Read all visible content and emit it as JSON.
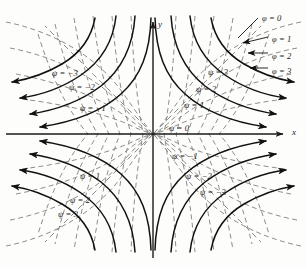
{
  "figure": {
    "background": "#fdfdfb",
    "stream_color": "#111111",
    "potential_color": "#8d8d8d",
    "axis_color": "#1a1a1a"
  },
  "axes": {
    "x_label": "x",
    "y_label": "y",
    "origin": {
      "x": 153,
      "y": 134
    },
    "x_range": [
      -155,
      155
    ],
    "y_range": [
      -134,
      134
    ]
  },
  "chart_data": {
    "type": "line",
    "xlabel": "x",
    "ylabel": "y",
    "grid": false,
    "legend": "none",
    "series": [
      {
        "name": "streamlines",
        "style": "solid",
        "color": "#111111",
        "equation": "psi = k, hyperbolas x*y = constant",
        "arrowheads": true,
        "levels": [
          {
            "label": "ψ = 0",
            "value": 0,
            "quadrant": "all",
            "form": "diagonal asymptotes through origin"
          },
          {
            "label": "ψ = 1",
            "value": 1,
            "quadrant": "upper-right"
          },
          {
            "label": "ψ = 2",
            "value": 2,
            "quadrant": "upper-right"
          },
          {
            "label": "ψ = 3",
            "value": 3,
            "quadrant": "upper-right"
          },
          {
            "label": "ψ = −1",
            "value": -1,
            "quadrant": "upper-left"
          },
          {
            "label": "ψ = −2",
            "value": -2,
            "quadrant": "upper-left"
          },
          {
            "label": "ψ = −3",
            "value": -3,
            "quadrant": "upper-left"
          },
          {
            "label": "ψ = 1",
            "value": 1,
            "quadrant": "lower-left"
          },
          {
            "label": "ψ = 2",
            "value": 2,
            "quadrant": "lower-left"
          },
          {
            "label": "ψ = 3",
            "value": 3,
            "quadrant": "lower-left"
          },
          {
            "label": "ψ = −1",
            "value": -1,
            "quadrant": "lower-right"
          },
          {
            "label": "ψ = −2",
            "value": -2,
            "quadrant": "lower-right"
          },
          {
            "label": "ψ = −3",
            "value": -3,
            "quadrant": "lower-right"
          }
        ]
      },
      {
        "name": "equipotentials",
        "style": "dashed",
        "color": "#8d8d8d",
        "equation": "phi = k, hyperbolas x^2 - y^2 = constant",
        "arrowheads": false,
        "levels": [
          {
            "label": "φ = 0",
            "value": 0
          },
          {
            "label": "φ = 1",
            "value": 1
          },
          {
            "label": "φ = 2",
            "value": 2
          },
          {
            "label": "φ = 3",
            "value": 3
          }
        ]
      }
    ]
  },
  "labels": {
    "axis": [
      {
        "name": "x-axis-label",
        "text": "x",
        "x": 292,
        "y": 128
      },
      {
        "name": "y-axis-label",
        "text": "y",
        "x": 158,
        "y": 20
      }
    ],
    "psi": [
      {
        "text": "ψ = −3",
        "x": 52,
        "y": 69
      },
      {
        "text": "ψ = −2",
        "x": 69,
        "y": 83
      },
      {
        "text": "ψ = −1",
        "x": 80,
        "y": 104
      },
      {
        "text": "ψ = 3",
        "x": 208,
        "y": 68
      },
      {
        "text": "ψ = 2",
        "x": 196,
        "y": 85
      },
      {
        "text": "ψ = 1",
        "x": 184,
        "y": 101
      },
      {
        "text": "ψ = 0",
        "x": 169,
        "y": 124
      },
      {
        "text": "ψ = −1",
        "x": 172,
        "y": 152
      },
      {
        "text": "ψ = −2",
        "x": 186,
        "y": 172
      },
      {
        "text": "ψ = −3",
        "x": 200,
        "y": 188
      },
      {
        "text": "ψ = 1",
        "x": 80,
        "y": 172
      },
      {
        "text": "ψ = 2",
        "x": 70,
        "y": 196
      },
      {
        "text": "ψ = 3",
        "x": 58,
        "y": 210
      }
    ],
    "phi": [
      {
        "text": "φ = 0",
        "x": 262,
        "y": 14
      },
      {
        "text": "φ = 1",
        "x": 272,
        "y": 35
      },
      {
        "text": "φ = 2",
        "x": 272,
        "y": 52
      },
      {
        "text": "φ = 3",
        "x": 272,
        "y": 67
      }
    ]
  }
}
